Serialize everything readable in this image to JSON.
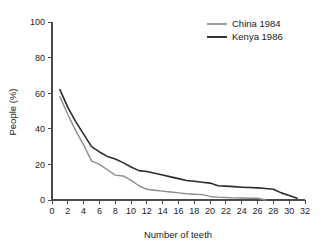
{
  "chart_data": {
    "type": "line",
    "title": "",
    "xlabel": "Number of teeth",
    "ylabel": "People (%)",
    "xlim": [
      0,
      32
    ],
    "ylim": [
      0,
      100
    ],
    "xticks": [
      0,
      2,
      4,
      6,
      8,
      10,
      12,
      14,
      16,
      18,
      20,
      22,
      24,
      26,
      28,
      30,
      32
    ],
    "yticks": [
      0,
      20,
      40,
      60,
      80,
      100
    ],
    "xtick_labels": [
      "0",
      "2",
      "4",
      "6",
      "8",
      "10",
      "12",
      "14",
      "16",
      "18",
      "20",
      "22",
      "24",
      "26",
      "28",
      "30",
      "32"
    ],
    "ytick_labels": [
      "0",
      "20",
      "40",
      "60",
      "80",
      "100"
    ],
    "grid": false,
    "legend_position": "top-right",
    "series": [
      {
        "name": "China 1984",
        "color": "#8c8c8c",
        "x": [
          1,
          2,
          3,
          4,
          5,
          6,
          7,
          8,
          9,
          10,
          11,
          12,
          13,
          14,
          15,
          16,
          17,
          18,
          19,
          20,
          21,
          22,
          23,
          24,
          25,
          26,
          27
        ],
        "values": [
          58,
          48,
          39,
          31,
          22,
          20,
          17,
          14,
          13.5,
          11,
          8,
          6,
          5.5,
          5,
          4.5,
          4,
          3.5,
          3.2,
          3,
          2,
          1.6,
          1.4,
          1.2,
          1.1,
          1,
          1,
          0
        ]
      },
      {
        "name": "Kenya 1986",
        "color": "#2b2b2b",
        "x": [
          1,
          2,
          3,
          4,
          5,
          6,
          7,
          8,
          9,
          10,
          11,
          12,
          13,
          14,
          15,
          16,
          17,
          18,
          19,
          20,
          21,
          22,
          23,
          24,
          25,
          26,
          27,
          28,
          29,
          30,
          31
        ],
        "values": [
          62,
          52,
          44,
          37,
          30,
          27,
          24.5,
          23,
          21,
          18.5,
          16.5,
          16,
          15,
          14,
          13,
          12,
          11,
          10.5,
          10,
          9.5,
          8,
          7.8,
          7.5,
          7.2,
          7,
          6.8,
          6.5,
          6,
          4,
          2.5,
          1
        ]
      }
    ]
  },
  "legend": {
    "entries": [
      {
        "label": "China 1984",
        "color": "#8c8c8c"
      },
      {
        "label": "Kenya 1986",
        "color": "#2b2b2b"
      }
    ]
  },
  "axes": {
    "x_title": "Number of teeth",
    "y_title": "People (%)"
  }
}
